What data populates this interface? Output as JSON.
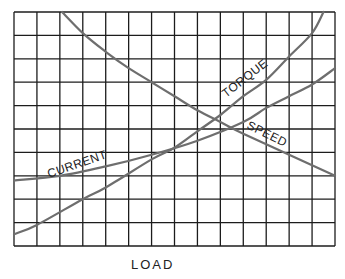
{
  "chart_data": {
    "type": "line",
    "title": "",
    "xlabel": "LOAD",
    "ylabel": "",
    "grid": true,
    "grid_columns": 14,
    "grid_rows": 10,
    "x_range": [
      0,
      14
    ],
    "y_range": [
      0,
      10
    ],
    "legend": "inline labels on curves",
    "series": [
      {
        "name": "CURRENT",
        "x": [
          0,
          2,
          4,
          6,
          8,
          10,
          11,
          12,
          13,
          14
        ],
        "y": [
          2.8,
          3.0,
          3.4,
          3.9,
          4.5,
          5.3,
          5.9,
          6.4,
          6.9,
          7.6
        ]
      },
      {
        "name": "TORQUE",
        "x": [
          0,
          1,
          3,
          4,
          6,
          7,
          8,
          9,
          10,
          11,
          12,
          13,
          13.5
        ],
        "y": [
          0.5,
          0.9,
          2.0,
          2.5,
          3.7,
          4.2,
          4.9,
          5.6,
          6.4,
          7.1,
          8.1,
          9.1,
          10
        ]
      },
      {
        "name": "SPEED",
        "x": [
          2.1,
          3,
          4,
          5,
          6,
          7,
          8,
          9,
          10,
          12,
          14
        ],
        "y": [
          10,
          9.1,
          8.3,
          7.6,
          7.0,
          6.4,
          5.8,
          5.3,
          4.8,
          3.9,
          3.0
        ]
      }
    ]
  },
  "labels": {
    "current": "CURRENT",
    "torque": "TORQUE",
    "speed": "SPEED",
    "x_axis": "LOAD"
  }
}
